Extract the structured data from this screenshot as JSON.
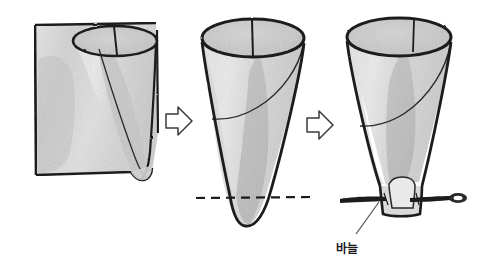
{
  "illustration": {
    "title": "Paper cone construction steps",
    "style": "hand-drawn pencil and gray wash sketch",
    "background_color": "#ffffff",
    "ink_color": "#1c1c1c",
    "paper_light": "#eeeeee",
    "paper_mid": "#d7d7d7",
    "paper_dark": "#bdbdbd",
    "paper_shadow": "#c4c4c4"
  },
  "steps": [
    {
      "index": 1,
      "name": "rolled-paper-sheet",
      "description": "Square sheet of paper being rolled from a corner into a cone"
    },
    {
      "index": 2,
      "name": "formed-cone-with-cut-line",
      "description": "Finished paper cone with dashed horizontal line marking where the tip is cut"
    },
    {
      "index": 3,
      "name": "truncated-cone-with-needle",
      "description": "Cone with the tip cut flat and a sewing needle pushed through the base"
    }
  ],
  "arrows": [
    {
      "name": "arrow-step1-to-step2",
      "direction": "right"
    },
    {
      "name": "arrow-step2-to-step3",
      "direction": "right"
    }
  ],
  "annotations": [
    {
      "name": "needle-label",
      "text": "바늘",
      "language": "ko",
      "meaning": "needle",
      "has_leader_line": true
    }
  ]
}
